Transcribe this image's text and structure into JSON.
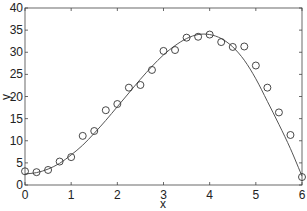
{
  "chart_data": {
    "type": "scatter",
    "title": "",
    "xlabel": "x",
    "ylabel": "y",
    "xlim": [
      0,
      6
    ],
    "ylim": [
      0,
      40
    ],
    "xticks": [
      0,
      1,
      2,
      3,
      4,
      5,
      6
    ],
    "yticks": [
      0,
      5,
      10,
      15,
      20,
      25,
      30,
      35,
      40
    ],
    "grid": false,
    "legend": null,
    "series": [
      {
        "name": "data",
        "kind": "scatter",
        "marker": "open-circle",
        "x": [
          0,
          0.25,
          0.5,
          0.75,
          1.0,
          1.25,
          1.5,
          1.75,
          2.0,
          2.25,
          2.5,
          2.75,
          3.0,
          3.25,
          3.5,
          3.75,
          4.0,
          4.25,
          4.5,
          4.75,
          5.0,
          5.25,
          5.5,
          5.75,
          6.0
        ],
        "y": [
          3.1,
          2.9,
          3.4,
          5.3,
          6.3,
          11.1,
          12.2,
          16.9,
          18.3,
          22.0,
          22.6,
          26.0,
          30.3,
          30.5,
          33.3,
          33.5,
          34.0,
          32.3,
          31.2,
          31.3,
          27.0,
          22.0,
          16.4,
          11.3,
          1.8
        ]
      },
      {
        "name": "fit",
        "kind": "line",
        "x": [
          0,
          0.25,
          0.5,
          0.75,
          1.0,
          1.25,
          1.5,
          1.75,
          2.0,
          2.25,
          2.5,
          2.75,
          3.0,
          3.25,
          3.5,
          3.75,
          4.0,
          4.25,
          4.5,
          4.75,
          5.0,
          5.25,
          5.5,
          5.75,
          6.0
        ],
        "y": [
          2.5,
          2.8,
          3.6,
          4.9,
          6.8,
          9.0,
          11.7,
          14.6,
          17.7,
          20.8,
          23.9,
          26.8,
          29.4,
          31.5,
          33.1,
          34.0,
          34.0,
          33.1,
          31.2,
          28.2,
          24.0,
          18.9,
          13.7,
          8.2,
          2.0
        ]
      }
    ]
  },
  "colors": {
    "axis": "#444444",
    "marker": "#333333",
    "line": "#555555"
  }
}
